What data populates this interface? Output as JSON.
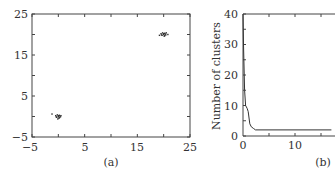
{
  "chart_data": [
    {
      "type": "scatter",
      "panel_label": "(a)",
      "title": "",
      "xlabel": "",
      "ylabel": "",
      "xlim": [
        -5,
        25
      ],
      "ylim": [
        -5,
        25
      ],
      "x_ticks": [
        "-5",
        "5",
        "15",
        "25"
      ],
      "y_ticks": [
        "-5",
        "5",
        "15",
        "25"
      ],
      "grid": false,
      "series": [
        {
          "name": "cluster 1",
          "center": [
            0,
            0
          ],
          "points": [
            [
              -0.5,
              0.2
            ],
            [
              -0.3,
              -0.2
            ],
            [
              0,
              0
            ],
            [
              0.2,
              0.3
            ],
            [
              0.4,
              -0.1
            ],
            [
              0.1,
              -0.4
            ],
            [
              -0.2,
              0.4
            ],
            [
              0.3,
              0.1
            ],
            [
              -0.4,
              -0.1
            ],
            [
              0,
              0.2
            ],
            [
              0.2,
              -0.3
            ],
            [
              -0.1,
              -0.6
            ],
            [
              0.5,
              0.2
            ],
            [
              -1.2,
              0.6
            ]
          ]
        },
        {
          "name": "cluster 2",
          "center": [
            20,
            20
          ],
          "points": [
            [
              19.5,
              20.2
            ],
            [
              19.7,
              19.8
            ],
            [
              20,
              20
            ],
            [
              20.2,
              20.3
            ],
            [
              20.4,
              19.9
            ],
            [
              20.1,
              19.6
            ],
            [
              19.8,
              20.4
            ],
            [
              20.3,
              20.1
            ],
            [
              19.6,
              19.9
            ],
            [
              20,
              20.2
            ],
            [
              20.2,
              19.7
            ],
            [
              20.8,
              20
            ],
            [
              19.2,
              19.8
            ],
            [
              20.5,
              20.4
            ]
          ]
        }
      ]
    },
    {
      "type": "line",
      "panel_label": "(b)",
      "title": "",
      "xlabel": "",
      "ylabel": "Number of clusters",
      "xlim": [
        0,
        17
      ],
      "ylim": [
        0,
        40
      ],
      "x_ticks": [
        "0",
        "10"
      ],
      "y_ticks": [
        "0",
        "10",
        "20",
        "30",
        "40"
      ],
      "grid": false,
      "x": [
        0,
        0.1,
        0.3,
        0.5,
        0.8,
        1.0,
        1.3,
        1.6,
        2.0,
        2.4,
        5,
        10,
        15,
        17
      ],
      "values": [
        40,
        30,
        15,
        10,
        9,
        8,
        4,
        3,
        2.5,
        2,
        2,
        2,
        2,
        2
      ]
    }
  ]
}
